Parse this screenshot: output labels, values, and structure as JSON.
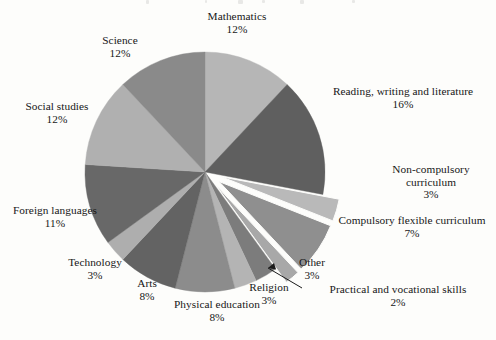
{
  "chart_data": {
    "type": "pie",
    "title": "",
    "subtitle": "",
    "xlabel": "",
    "ylabel": "",
    "legend_position": "none",
    "grid": false,
    "units": "percent",
    "start_angle_deg": 0,
    "direction": "clockwise",
    "total": 100,
    "categories": [
      "Mathematics",
      "Reading, writing and literature",
      "Non-compulsory curriculum",
      "Compulsory flexible curriculum",
      "Practical and vocational skills",
      "Other",
      "Religion",
      "Physical education",
      "Arts",
      "Technology",
      "Foreign languages",
      "Social studies",
      "Science"
    ],
    "values": [
      12,
      16,
      3,
      7,
      2,
      3,
      3,
      8,
      8,
      3,
      11,
      12,
      12
    ],
    "labels_pct": [
      "12%",
      "16%",
      "3%",
      "7%",
      "2%",
      "3%",
      "3%",
      "8%",
      "8%",
      "3%",
      "11%",
      "12%",
      "12%"
    ],
    "colors": [
      "#b6b6b6",
      "#5f5f5f",
      "#b9b9b9",
      "#8f8f8f",
      "#a8a8a8",
      "#7c7c7c",
      "#b4b4b4",
      "#8c8c8c",
      "#636363",
      "#aeaeae",
      "#686868",
      "#b0b0b0",
      "#8a8a8a"
    ],
    "exploded": [
      "Non-compulsory curriculum",
      "Compulsory flexible curriculum",
      "Practical and vocational skills"
    ],
    "slices": [
      {
        "label": "Mathematics",
        "value": 12,
        "pct": "12%",
        "color": "#b6b6b6",
        "exploded": false
      },
      {
        "label": "Reading, writing and literature",
        "value": 16,
        "pct": "16%",
        "color": "#5f5f5f",
        "exploded": false
      },
      {
        "label": "Non-compulsory curriculum",
        "value": 3,
        "pct": "3%",
        "color": "#b9b9b9",
        "exploded": true
      },
      {
        "label": "Compulsory flexible curriculum",
        "value": 7,
        "pct": "7%",
        "color": "#8f8f8f",
        "exploded": true
      },
      {
        "label": "Practical and vocational skills",
        "value": 2,
        "pct": "2%",
        "color": "#a8a8a8",
        "exploded": true
      },
      {
        "label": "Other",
        "value": 3,
        "pct": "3%",
        "color": "#7c7c7c",
        "exploded": false
      },
      {
        "label": "Religion",
        "value": 3,
        "pct": "3%",
        "color": "#b4b4b4",
        "exploded": false
      },
      {
        "label": "Physical education",
        "value": 8,
        "pct": "8%",
        "color": "#8c8c8c",
        "exploded": false
      },
      {
        "label": "Arts",
        "value": 8,
        "pct": "8%",
        "color": "#636363",
        "exploded": false
      },
      {
        "label": "Technology",
        "value": 3,
        "pct": "3%",
        "color": "#aeaeae",
        "exploded": false
      },
      {
        "label": "Foreign languages",
        "value": 11,
        "pct": "11%",
        "color": "#686868",
        "exploded": false
      },
      {
        "label": "Social studies",
        "value": 12,
        "pct": "12%",
        "color": "#b0b0b0",
        "exploded": false
      },
      {
        "label": "Science",
        "value": 12,
        "pct": "12%",
        "color": "#8a8a8a",
        "exploded": false
      }
    ],
    "annotations": [
      {
        "name": "practical-skills-leader",
        "text": "Practical and vocational skills",
        "type": "arrow",
        "points_to": "Practical and vocational skills"
      }
    ]
  },
  "labels": {
    "mathematics": {
      "name": "Mathematics",
      "pct": "12%"
    },
    "reading": {
      "name": "Reading, writing and literature",
      "pct": "16%"
    },
    "noncompulsory": {
      "name": "Non-compulsory curriculum",
      "pct": "3%"
    },
    "compulsoryflexible": {
      "name": "Compulsory flexible curriculum",
      "pct": "7%"
    },
    "practical": {
      "name": "Practical and vocational skills",
      "pct": "2%"
    },
    "other": {
      "name": "Other",
      "pct": "3%"
    },
    "religion": {
      "name": "Religion",
      "pct": "3%"
    },
    "physicaleducation": {
      "name": "Physical education",
      "pct": "8%"
    },
    "arts": {
      "name": "Arts",
      "pct": "8%"
    },
    "technology": {
      "name": "Technology",
      "pct": "3%"
    },
    "foreignlanguages": {
      "name": "Foreign languages",
      "pct": "11%"
    },
    "socialstudies": {
      "name": "Social studies",
      "pct": "12%"
    },
    "science": {
      "name": "Science",
      "pct": "12%"
    }
  },
  "colors": {
    "background": "#fdfdfb",
    "text": "#171717",
    "slice_light": "#b6b6b6",
    "slice_medium": "#8a8a8a",
    "slice_dark": "#5f5f5f",
    "leader_line": "#1b1b1b"
  }
}
